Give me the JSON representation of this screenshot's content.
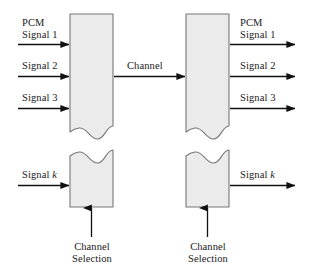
{
  "diagram": {
    "colors": {
      "box_fill": "#ebebeb",
      "box_stroke": "#777777",
      "line": "#111111",
      "text": "#1a1a1a",
      "background": "#ffffff"
    },
    "inputs": {
      "signal_1": {
        "line1": "PCM",
        "line2": "Signal 1"
      },
      "signal_2": {
        "line1": "Signal 2"
      },
      "signal_3": {
        "line1": "Signal 3"
      },
      "signal_k": {
        "line1": "Signal k",
        "italic_part": "k"
      }
    },
    "outputs": {
      "signal_1": {
        "line1": "PCM",
        "line2": "Signal 1"
      },
      "signal_2": {
        "line1": "Signal 2"
      },
      "signal_3": {
        "line1": "Signal 3"
      },
      "signal_k": {
        "line1": "Signal k",
        "italic_part": "k"
      }
    },
    "channel": {
      "label": "Channel"
    },
    "selection_left": {
      "line1": "Channel",
      "line2": "Selection"
    },
    "selection_right": {
      "line1": "Channel",
      "line2": "Selection"
    },
    "blocks": {
      "left_multiplexer": {
        "name": "multiplexer"
      },
      "right_demultiplexer": {
        "name": "demultiplexer"
      }
    }
  }
}
